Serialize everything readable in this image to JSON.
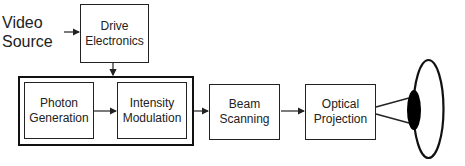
{
  "diagram": {
    "input_label": [
      "Video",
      "Source"
    ],
    "blocks": {
      "drive": {
        "line1": "Drive",
        "line2": "Electronics"
      },
      "photon": {
        "line1": "Photon",
        "line2": "Generation"
      },
      "intensity": {
        "line1": "Intensity",
        "line2": "Modulation"
      },
      "beam": {
        "line1": "Beam",
        "line2": "Scanning"
      },
      "optical": {
        "line1": "Optical",
        "line2": "Projection"
      }
    },
    "grouping": "photon-generation + intensity-modulation",
    "output": "eye-icon",
    "colors": {
      "stroke": "#222222",
      "background": "#ffffff",
      "pupil": "#000000"
    }
  }
}
